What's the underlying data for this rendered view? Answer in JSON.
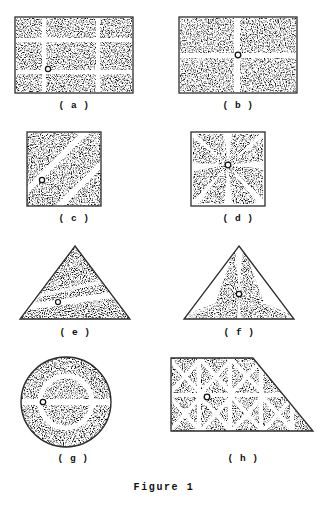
{
  "figure": {
    "caption": "Figure 1",
    "stroke_color": "#2b2b2b",
    "stipple_color": "#4a4a4a",
    "background_color": "#ffffff",
    "marker_color": "#111111",
    "panels": [
      {
        "id": "a",
        "label": "( a )",
        "shape": "rectangle",
        "partition": "3x3-grid",
        "marker": {
          "x": 0.285,
          "y": 0.675
        },
        "description": "rectangle divided into a 3 by 3 grid of stippled cells by white bands"
      },
      {
        "id": "b",
        "label": "( b )",
        "shape": "rectangle",
        "partition": "2x2-quadrants",
        "marker": {
          "x": 0.5,
          "y": 0.5
        },
        "description": "rectangle divided into four quadrants by a white cross"
      },
      {
        "id": "c",
        "label": "( c )",
        "shape": "square",
        "partition": "diagonal-bands",
        "marker": {
          "x": 0.205,
          "y": 0.645
        },
        "description": "square divided by diagonal white bands running at 45 degrees"
      },
      {
        "id": "d",
        "label": "( d )",
        "shape": "square",
        "partition": "radial-8-spokes",
        "marker": {
          "x": 0.5,
          "y": 0.46
        },
        "description": "square divided by eight white spokes radiating from the centre"
      },
      {
        "id": "e",
        "label": "( e )",
        "shape": "triangle",
        "partition": "single-oblique-band",
        "marker": {
          "x": 0.355,
          "y": 0.735
        },
        "description": "equilateral triangle crossed by one faint oblique white band"
      },
      {
        "id": "f",
        "label": "( f )",
        "shape": "triangle",
        "partition": "radial-6-spokes",
        "marker": {
          "x": 0.5,
          "y": 0.64
        },
        "description": "equilateral triangle divided by white spokes radiating from an interior point"
      },
      {
        "id": "g",
        "label": "( g )",
        "shape": "circle",
        "partition": "annulus-and-horizontal-band",
        "marker": {
          "x": 0.28,
          "y": 0.5
        },
        "description": "circle with a white concentric ring and a white horizontal band"
      },
      {
        "id": "h",
        "label": "( h )",
        "shape": "clipped-rectangle",
        "partition": "grid-with-diagonals",
        "marker": {
          "x": 0.26,
          "y": 0.46
        },
        "description": "rectangle with the top right corner cut off, divided into squares crossed by diagonals"
      }
    ]
  }
}
